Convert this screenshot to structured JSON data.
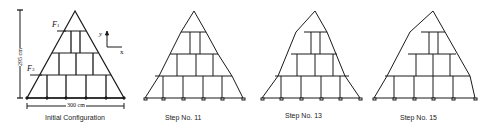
{
  "figure": {
    "panels": [
      {
        "id": "initial",
        "caption": "Initial Configuration",
        "labels": {
          "force_top": "F",
          "force_top_sub": "1",
          "force_bottom": "F",
          "force_bottom_sub": "3",
          "axis_y": "y",
          "axis_x": "x",
          "height_dim": "295 cm",
          "width_dim": "300 cm"
        }
      },
      {
        "id": "step11",
        "caption": "Step No. 11"
      },
      {
        "id": "step13",
        "caption": "Step No. 13"
      },
      {
        "id": "step15",
        "caption": "Step No. 15"
      }
    ],
    "line_color": "#1a1a1a"
  }
}
